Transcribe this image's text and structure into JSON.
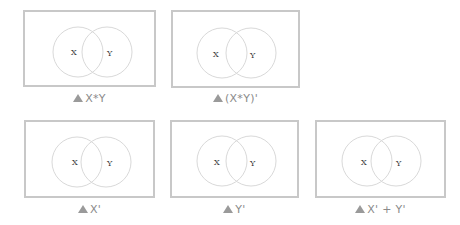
{
  "colors": {
    "border": "#c8c8c8",
    "circle": "#d9d9d9",
    "caption": "#8a8a8a",
    "triangle": "#9a9a9a"
  },
  "circle_labels": {
    "left": "X",
    "right": "Y"
  },
  "diagrams": [
    {
      "caption": "X*Y"
    },
    {
      "caption": "(X*Y)'"
    },
    {
      "caption": "X'"
    },
    {
      "caption": "Y'"
    },
    {
      "caption": "X' + Y'"
    }
  ]
}
